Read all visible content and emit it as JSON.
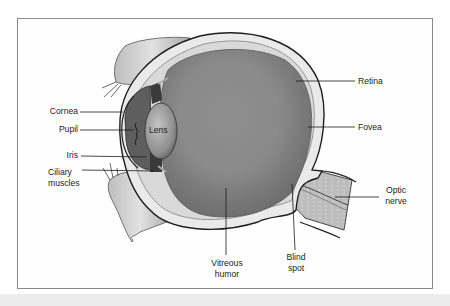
{
  "figure": {
    "type": "anatomical-diagram",
    "colors": {
      "background": "#ffffff",
      "frame_border": "#8a8a8a",
      "bottom_band": "#ececec",
      "vitreous": "#8c8c8c",
      "sclera": "#e8e8e8",
      "outline": "#1e1e1e",
      "label_text": "#1b1b1b"
    }
  },
  "labels": {
    "cornea": "Cornea",
    "pupil": "Pupil",
    "iris": "Iris",
    "ciliary_line1": "Ciliary",
    "ciliary_line2": "muscles",
    "lens": "Lens",
    "retina": "Retina",
    "fovea": "Fovea",
    "optic_line1": "Optic",
    "optic_line2": "nerve",
    "vitreous_line1": "Vitreous",
    "vitreous_line2": "humor",
    "blind_line1": "Blind",
    "blind_line2": "spot"
  }
}
